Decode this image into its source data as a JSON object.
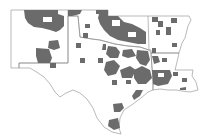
{
  "map": {
    "type": "choropleth",
    "region": "South Central United States",
    "states": [
      "New Mexico",
      "Texas",
      "Oklahoma",
      "Arkansas",
      "Louisiana"
    ],
    "style": "grayscale county map",
    "colors": {
      "background": "#ffffff",
      "boundary": "#8a8a8a",
      "highlighted_county": "#6b6b6b",
      "unshaded_county": "#ffffff"
    },
    "legend": null,
    "labels": []
  }
}
